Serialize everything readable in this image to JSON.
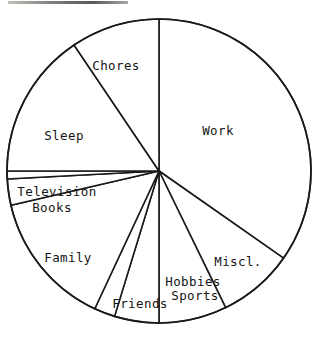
{
  "chart_data": {
    "type": "pie",
    "title": "",
    "subtitle": "",
    "xlabel": "",
    "ylabel": "",
    "legend": "none",
    "grid": false,
    "labels_shown_on_slices": true,
    "value_units": "share of day (degrees of circle)",
    "total_degrees": 360,
    "categories": [
      "Work",
      "Miscl.",
      "Sports",
      "Hobbies",
      "Friends",
      "Family",
      "Books",
      "Television",
      "Sleep",
      "Chores"
    ],
    "values": [
      125,
      29,
      26,
      17,
      8,
      52,
      13,
      10,
      56,
      24
    ],
    "slices": [
      {
        "label": "Work",
        "value": 125,
        "start_angle": 90,
        "end_angle": -35,
        "label_x": 218,
        "label_y": 131
      },
      {
        "label": "Miscl.",
        "value": 29,
        "start_angle": -35,
        "end_angle": -64,
        "label_x": 238,
        "label_y": 262
      },
      {
        "label": "Sports",
        "value": 26,
        "start_angle": -64,
        "end_angle": -90,
        "label_x": 195,
        "label_y": 296
      },
      {
        "label": "Hobbies",
        "value": 17,
        "start_angle": -90,
        "end_angle": -107,
        "label_x": 193,
        "label_y": 282
      },
      {
        "label": "Friends",
        "value": 8,
        "start_angle": -107,
        "end_angle": -115,
        "label_x": 140,
        "label_y": 304
      },
      {
        "label": "Family",
        "value": 52,
        "start_angle": -115,
        "end_angle": -167,
        "label_x": 68,
        "label_y": 258
      },
      {
        "label": "Books",
        "value": 13,
        "start_angle": -167,
        "end_angle": -177,
        "label_x": 52,
        "label_y": 208
      },
      {
        "label": "Television",
        "value": 10,
        "start_angle": -177,
        "end_angle": 180,
        "label_x": 57,
        "label_y": 192
      },
      {
        "label": "Sleep",
        "value": 56,
        "start_angle": 180,
        "end_angle": 124,
        "label_x": 64,
        "label_y": 136
      },
      {
        "label": "Chores",
        "value": 24,
        "start_angle": 124,
        "end_angle": 90,
        "label_x": 116,
        "label_y": 66
      }
    ],
    "geometry": {
      "center_x": 159,
      "center_y": 171,
      "radius": 152
    },
    "colors": {
      "slice_fill": "#ffffff",
      "slice_stroke": "#1a1a1a",
      "label_text": "#141414",
      "background": "#ffffff"
    }
  }
}
